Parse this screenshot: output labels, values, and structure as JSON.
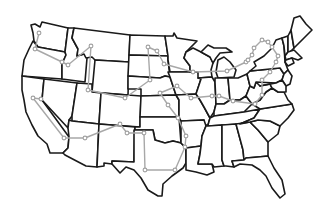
{
  "map": {
    "title": "",
    "region": "Contiguous United States",
    "style": {
      "background": "#ffffff",
      "border_color": "#1a1a1a",
      "route_color": "#a8a8a8",
      "node_fill": "#ffffff",
      "node_stroke": "#a0a0a0"
    },
    "route_nodes": [
      [
        39,
        33
      ],
      [
        35,
        49
      ],
      [
        62,
        62
      ],
      [
        68,
        65
      ],
      [
        91,
        46
      ],
      [
        88,
        90
      ],
      [
        125,
        98
      ],
      [
        150,
        80
      ],
      [
        148,
        47
      ],
      [
        157,
        51
      ],
      [
        164,
        64
      ],
      [
        193,
        72
      ],
      [
        227,
        71
      ],
      [
        246,
        62
      ],
      [
        248,
        60
      ],
      [
        252,
        55
      ],
      [
        254,
        48
      ],
      [
        262,
        40
      ],
      [
        268,
        42
      ],
      [
        272,
        47
      ],
      [
        278,
        56
      ],
      [
        276,
        62
      ],
      [
        270,
        72
      ],
      [
        262,
        80
      ],
      [
        262,
        95
      ],
      [
        255,
        104
      ],
      [
        233,
        101
      ],
      [
        219,
        96
      ],
      [
        212,
        96
      ],
      [
        191,
        98
      ],
      [
        177,
        86
      ],
      [
        160,
        93
      ],
      [
        168,
        105
      ],
      [
        178,
        118
      ],
      [
        186,
        136
      ],
      [
        185,
        147
      ],
      [
        175,
        170
      ],
      [
        145,
        170
      ],
      [
        144,
        133
      ],
      [
        127,
        133
      ],
      [
        120,
        124
      ],
      [
        85,
        138
      ],
      [
        64,
        138
      ],
      [
        33,
        98
      ],
      [
        41,
        99
      ]
    ]
  }
}
